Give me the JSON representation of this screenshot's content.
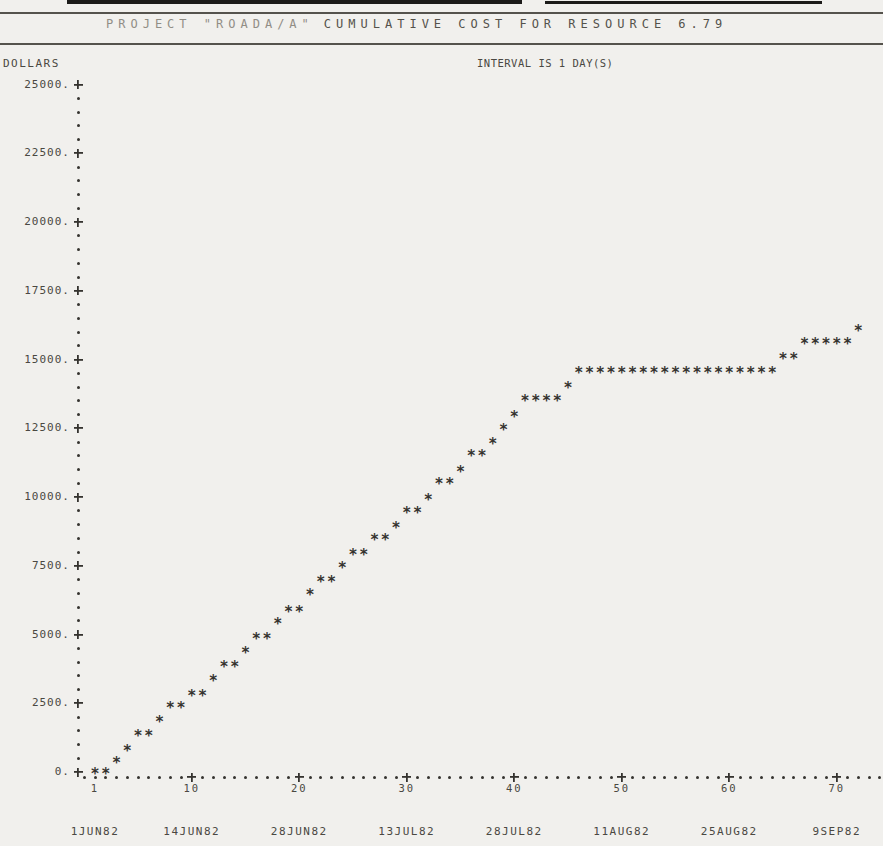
{
  "header": {
    "title_left": "PROJECT \"ROADA/A\"",
    "title_right": "CUMULATIVE COST FOR RESOURCE 6.79"
  },
  "chart_labels": {
    "y_axis_title": "DOLLARS",
    "interval_note": "INTERVAL IS 1 DAY(S)",
    "y_tick_labels": [
      "25000.",
      "22500.",
      "20000.",
      "17500.",
      "15000.",
      "12500.",
      "10000.",
      "7500.",
      "5000.",
      "2500.",
      "0."
    ],
    "x_tick_labels": [
      "1",
      "10",
      "20",
      "30",
      "40",
      "50",
      "60",
      "70"
    ],
    "x_date_labels": [
      "1JUN82",
      "14JUN82",
      "28JUN82",
      "13JUL82",
      "28JUL82",
      "11AUG82",
      "25AUG82",
      "9SEP82"
    ]
  },
  "colors": {
    "paper": "#f1f0ed",
    "ink": "#35332f",
    "label_ink": "#4a4842",
    "faded_title_ink": "#918e86"
  },
  "chart_data": {
    "type": "scatter",
    "marker": "asterisk",
    "subtitle": "INTERVAL IS 1 DAY(S)",
    "ylabel": "DOLLARS",
    "x_unit": "day",
    "xlim": [
      0,
      74
    ],
    "ylim": [
      0,
      25000
    ],
    "y_major_step": 2500,
    "y_minor_step": 500,
    "x_major_tick_days": [
      1,
      10,
      20,
      30,
      40,
      50,
      60,
      70
    ],
    "x_date_labels": [
      "1JUN82",
      "14JUN82",
      "28JUN82",
      "13JUL82",
      "28JUL82",
      "11AUG82",
      "25AUG82",
      "9SEP82"
    ],
    "first_day": 1,
    "cumulative_cost": [
      0,
      0,
      400,
      850,
      1400,
      1400,
      1900,
      2400,
      2400,
      2850,
      2850,
      3400,
      3900,
      3900,
      4400,
      4900,
      4900,
      5450,
      5900,
      5900,
      6500,
      7000,
      7000,
      7500,
      7950,
      7950,
      8500,
      8500,
      8950,
      9500,
      9500,
      9950,
      10550,
      10550,
      11000,
      11550,
      11550,
      12000,
      12500,
      13000,
      13550,
      13550,
      13550,
      13550,
      14050,
      14600,
      14600,
      14600,
      14600,
      14600,
      14600,
      14600,
      14600,
      14600,
      14600,
      14600,
      14600,
      14600,
      14600,
      14600,
      14600,
      14600,
      14600,
      14600,
      15100,
      15100,
      15650,
      15650,
      15650,
      15650,
      15650,
      16100
    ]
  }
}
